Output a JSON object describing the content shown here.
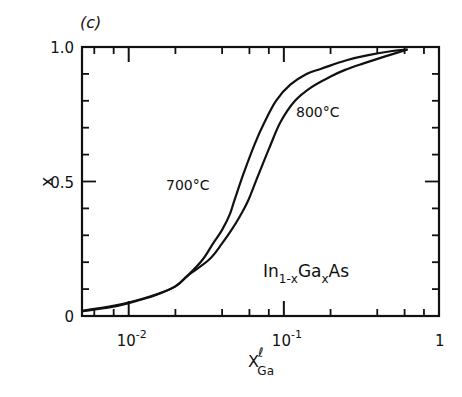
{
  "panel_label": "(c)",
  "chart_data": {
    "type": "line",
    "title": "",
    "panel": "(c)",
    "xlabel": "X",
    "xlabel_superscript": "ℓ",
    "xlabel_subscript": "Ga",
    "ylabel": "x",
    "xscale": "log",
    "xlim": [
      0.005,
      1
    ],
    "ylim": [
      0,
      1.0
    ],
    "x_major_ticks": [
      0.01,
      0.1,
      1
    ],
    "x_tick_labels": [
      {
        "base": "10",
        "exp": "-2",
        "value": 0.01
      },
      {
        "base": "10",
        "exp": "-1",
        "value": 0.1
      },
      {
        "base": "1",
        "exp": "",
        "value": 1
      }
    ],
    "x_minor_ticks": [
      0.006,
      0.008,
      0.02,
      0.04,
      0.06,
      0.08,
      0.2,
      0.4,
      0.6,
      0.8
    ],
    "y_ticks": [
      0,
      0.1,
      0.2,
      0.3,
      0.4,
      0.5,
      0.6,
      0.7,
      0.8,
      0.9,
      1.0
    ],
    "y_tick_labels": [
      {
        "text": "0",
        "value": 0
      },
      {
        "text": "0.5",
        "value": 0.5
      },
      {
        "text": "1.0",
        "value": 1.0
      }
    ],
    "grid": false,
    "legend": "none (curves labeled inline)",
    "series": [
      {
        "name": "700°C",
        "x": [
          0.005,
          0.0075,
          0.01,
          0.015,
          0.02,
          0.024,
          0.03,
          0.035,
          0.04,
          0.045,
          0.048,
          0.055,
          0.065,
          0.075,
          0.089,
          0.11,
          0.14,
          0.176,
          0.25,
          0.35,
          0.5,
          0.62
        ],
        "values": [
          0.02,
          0.035,
          0.05,
          0.08,
          0.11,
          0.15,
          0.21,
          0.27,
          0.32,
          0.38,
          0.43,
          0.53,
          0.64,
          0.72,
          0.8,
          0.86,
          0.9,
          0.92,
          0.95,
          0.97,
          0.985,
          0.99
        ]
      },
      {
        "name": "800°C",
        "x": [
          0.005,
          0.0075,
          0.01,
          0.015,
          0.02,
          0.024,
          0.033,
          0.04,
          0.046,
          0.052,
          0.059,
          0.068,
          0.08,
          0.095,
          0.118,
          0.15,
          0.2,
          0.248,
          0.33,
          0.45,
          0.62
        ],
        "values": [
          0.018,
          0.032,
          0.048,
          0.078,
          0.11,
          0.15,
          0.21,
          0.27,
          0.32,
          0.37,
          0.43,
          0.52,
          0.62,
          0.72,
          0.8,
          0.85,
          0.89,
          0.915,
          0.94,
          0.965,
          0.99
        ]
      }
    ],
    "annotations": [
      {
        "text": "700°C",
        "x": 0.03,
        "y": 0.53
      },
      {
        "text": "800°C",
        "x": 0.15,
        "y": 0.73
      },
      {
        "text": "In1-xGaxAs",
        "x": 0.12,
        "y": 0.22
      }
    ]
  },
  "labels": {
    "curve_700": "700°C",
    "curve_800": "800°C",
    "compound": {
      "a": "In",
      "a_sub": "1-x",
      "b": "Ga",
      "b_sub": "x",
      "c": "As"
    }
  }
}
